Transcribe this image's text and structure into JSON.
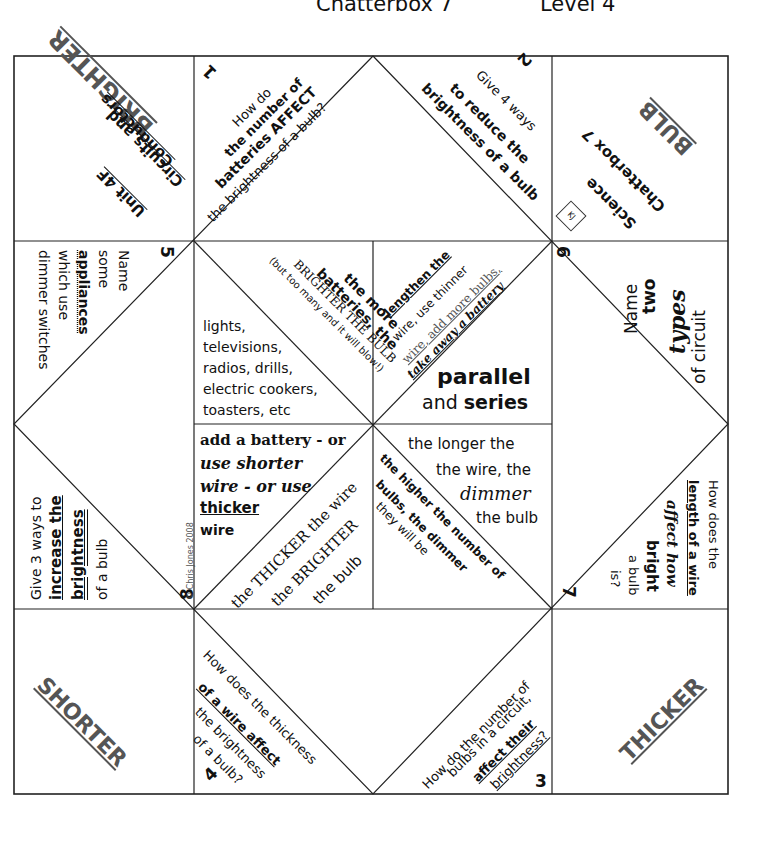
{
  "header": {
    "title": "Chatterbox 7",
    "level": "Level 4"
  },
  "corners": {
    "top_left": {
      "word": "BRIGHTER",
      "unit": "Unit 4F",
      "line2": "Circuits and",
      "line3": "Conductors"
    },
    "top_right": {
      "word": "BULB",
      "line1": "Chatterbox 7",
      "line2": "Science",
      "stamp": "KJ"
    },
    "bottom_left": {
      "word": "SHORTER"
    },
    "bottom_right": {
      "word": "THICKER"
    }
  },
  "questions": [
    {
      "number": "1",
      "lines": [
        "How do",
        "the number of",
        "batteries AFFECT",
        "the brightness of a bulb?"
      ]
    },
    {
      "number": "2",
      "lines": [
        "Give 4 ways",
        "to reduce the",
        "brightness of a bulb"
      ]
    },
    {
      "number": "3",
      "lines": [
        "How do the number of",
        "bulbs in a circuit,",
        "affect their",
        "brightness?"
      ]
    },
    {
      "number": "4",
      "lines": [
        "How does the thickness",
        "of a wire affect",
        "the brightness",
        "of a bulb?"
      ]
    },
    {
      "number": "5",
      "lines": [
        "Name",
        "some",
        "appliances",
        "which use",
        "dimmer switches"
      ]
    },
    {
      "number": "6",
      "lines": [
        "Name",
        "two",
        "types",
        "of circuit"
      ]
    },
    {
      "number": "7",
      "lines": [
        "How does the",
        "length of a wire",
        "affect how",
        "bright",
        "a bulb",
        "is?"
      ]
    },
    {
      "number": "8",
      "lines": [
        "Give 3 ways to",
        "increase the",
        "brightness",
        "of a bulb"
      ]
    }
  ],
  "answers": {
    "a1": {
      "lines": [
        "the more",
        "batteries, the",
        "BRIGHTER THE BULB",
        "(but too many and it will blow!)"
      ]
    },
    "a5": {
      "lines": [
        "lights,",
        "televisions,",
        "radios, drills,",
        "electric cookers,",
        "toasters, etc"
      ]
    },
    "a2": {
      "lines": [
        "lengthen the",
        "wire, use thinner",
        "wire, add more bulbs,",
        "take away a battery"
      ]
    },
    "a6": {
      "word1": "parallel",
      "word2_prefix": "and",
      "word2": "series"
    },
    "a8": {
      "lines": [
        "add a battery - or",
        "use shorter",
        "wire - or use",
        "thicker",
        "wire"
      ]
    },
    "a4": {
      "lines": [
        "the THICKER the wire",
        "the BRIGHTER",
        "the bulb"
      ]
    },
    "a7": {
      "lines": [
        "the longer the",
        "the wire, the",
        "dimmer",
        "the bulb"
      ]
    },
    "a3": {
      "lines": [
        "the higher the number of",
        "bulbs, the dimmer",
        "they will be"
      ]
    }
  },
  "copyright": "© Chris Jones 2008"
}
